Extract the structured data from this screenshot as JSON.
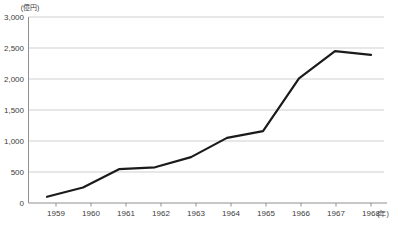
{
  "figure": {
    "background": "#ffffff"
  },
  "chart_data": {
    "type": "line",
    "title": "",
    "y_unit_label": "(億円)",
    "x_unit_label": "(年)",
    "categories": [
      "1959",
      "1960",
      "1961",
      "1962",
      "1963",
      "1964",
      "1965",
      "1966",
      "1967",
      "1968"
    ],
    "values": [
      100,
      250,
      545,
      575,
      740,
      1050,
      1160,
      2010,
      2450,
      2390
    ],
    "ylim": [
      0,
      3000
    ],
    "y_ticks": [
      0,
      500,
      1000,
      1500,
      2000,
      2500,
      3000
    ],
    "y_tick_labels": [
      "0",
      "500",
      "1,000",
      "1,500",
      "2,000",
      "2,500",
      "3,000"
    ],
    "grid": true,
    "legend": "none",
    "colors": {
      "line": "#1b1b1b",
      "grid": "#c9c9c9",
      "axis": "#8f8f8f",
      "text": "#3c3c3c",
      "background": "#ffffff"
    }
  }
}
